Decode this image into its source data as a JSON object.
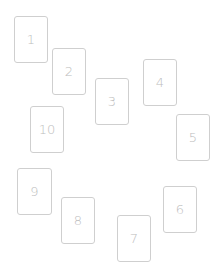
{
  "colors": {
    "background": "#ffffff",
    "card_border": "#cfcfcf",
    "card_text": "#bdbdbd"
  },
  "cards": [
    {
      "label": "1",
      "x": 14,
      "y": 16,
      "w": 34,
      "h": 47
    },
    {
      "label": "2",
      "x": 52,
      "y": 48,
      "w": 34,
      "h": 47
    },
    {
      "label": "3",
      "x": 95,
      "y": 78,
      "w": 34,
      "h": 47
    },
    {
      "label": "4",
      "x": 143,
      "y": 59,
      "w": 34,
      "h": 47
    },
    {
      "label": "5",
      "x": 176,
      "y": 114,
      "w": 34,
      "h": 47
    },
    {
      "label": "6",
      "x": 163,
      "y": 186,
      "w": 34,
      "h": 47
    },
    {
      "label": "7",
      "x": 117,
      "y": 215,
      "w": 34,
      "h": 47
    },
    {
      "label": "8",
      "x": 61,
      "y": 197,
      "w": 34,
      "h": 47
    },
    {
      "label": "9",
      "x": 17,
      "y": 168,
      "w": 35,
      "h": 47
    },
    {
      "label": "10",
      "x": 30,
      "y": 106,
      "w": 34,
      "h": 47
    }
  ]
}
